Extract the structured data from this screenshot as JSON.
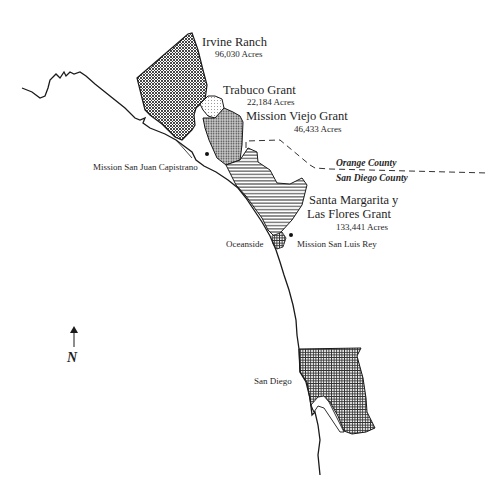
{
  "map": {
    "grants": [
      {
        "name": "Irvine Ranch",
        "acres": "96,030 Acres",
        "pattern": "fine-crosshatch"
      },
      {
        "name": "Trabuco Grant",
        "acres": "22,184 Acres",
        "pattern": "light-dots"
      },
      {
        "name": "Mission Viejo Grant",
        "acres": "46,433 Acres",
        "pattern": "dense-dots"
      },
      {
        "name_line1": "Santa Margarita  y",
        "name_line2": "Las Flores Grant",
        "acres": "133,441 Acres",
        "pattern": "horizontal-lines"
      }
    ],
    "places": {
      "mission_sjc": "Mission San Juan Capistrano",
      "oceanside": "Oceanside",
      "mission_slr": "Mission San Luis Rey",
      "san_diego": "San Diego"
    },
    "counties": {
      "north": "Orange County",
      "south": "San Diego County"
    },
    "north_arrow": "N",
    "colors": {
      "line": "#1a1a1a",
      "background": "#ffffff"
    }
  }
}
